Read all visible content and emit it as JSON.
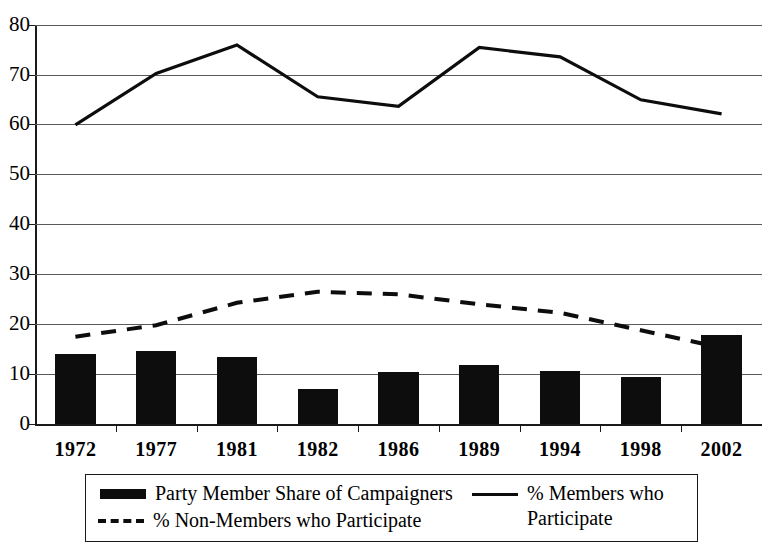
{
  "chart_data": {
    "type": "bar",
    "title": "",
    "xlabel": "",
    "ylabel": "",
    "categories": [
      "1972",
      "1977",
      "1981",
      "1982",
      "1986",
      "1989",
      "1994",
      "1998",
      "2002"
    ],
    "ylim": [
      0,
      80
    ],
    "yticks": [
      0,
      10,
      20,
      30,
      40,
      50,
      60,
      70,
      80
    ],
    "grid": true,
    "legend_position": "bottom",
    "series": [
      {
        "name": "Party Member Share of Campaigners",
        "type": "bar",
        "color": "#0d0d0d",
        "values": [
          14.1,
          14.7,
          13.4,
          7.0,
          10.4,
          11.8,
          10.6,
          9.4,
          17.8
        ]
      },
      {
        "name": "% Members who Participate",
        "type": "line",
        "style": "solid",
        "color": "#0d0d0d",
        "values": [
          60.0,
          70.3,
          76.0,
          65.6,
          63.7,
          75.5,
          73.6,
          65.0,
          62.2
        ]
      },
      {
        "name": "% Non-Members who Participate",
        "type": "line",
        "style": "dashed",
        "color": "#0d0d0d",
        "values": [
          17.5,
          19.8,
          24.3,
          26.5,
          26.0,
          24.0,
          22.3,
          18.8,
          15.3
        ]
      }
    ]
  },
  "axes": {
    "y_tick_labels": [
      "80",
      "70",
      "60",
      "50",
      "40",
      "30",
      "20",
      "10",
      "0"
    ],
    "x_tick_labels": [
      "1972",
      "1977",
      "1981",
      "1982",
      "1986",
      "1989",
      "1994",
      "1998",
      "2002"
    ]
  },
  "legend": {
    "entries": [
      {
        "label": "Party Member Share of Campaigners",
        "marker": "bar-swatch"
      },
      {
        "label": "% Non-Members who Participate",
        "marker": "dashed-line-swatch"
      },
      {
        "label": "% Members who\nParticipate",
        "marker": "solid-line-swatch"
      }
    ]
  }
}
